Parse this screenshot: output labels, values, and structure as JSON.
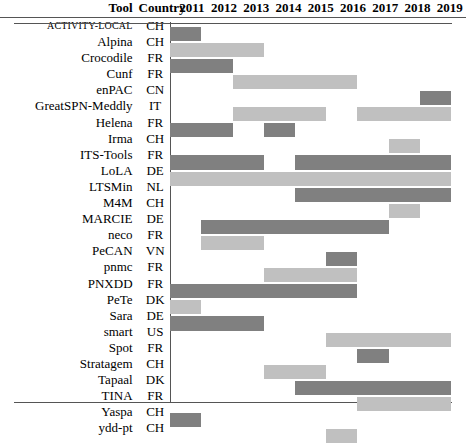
{
  "header": {
    "tool_label": "Tool",
    "country_label": "Country"
  },
  "colors": {
    "dark": "#808080",
    "light": "#c0c0c0",
    "rule": "#555555",
    "background": "#ffffff"
  },
  "chart_data": {
    "type": "heatmap",
    "title": "",
    "xlabel": "",
    "ylabel": "",
    "categories": [
      "2011",
      "2012",
      "2013",
      "2014",
      "2015",
      "2016",
      "2017",
      "2018",
      "2019"
    ],
    "legend": [
      {
        "name": "participated (dark)",
        "color": "#808080"
      },
      {
        "name": "participated (light)",
        "color": "#c0c0c0"
      }
    ],
    "rows": [
      {
        "tool": "ACTIVITY-LOCAL",
        "country": "CH",
        "smallcaps": true,
        "segments": [
          {
            "start": 0,
            "end": 0,
            "shade": "dark"
          }
        ],
        "years": [
          "2011"
        ]
      },
      {
        "tool": "Alpina",
        "country": "CH",
        "segments": [
          {
            "start": 0,
            "end": 2,
            "shade": "light"
          }
        ],
        "years": [
          "2011",
          "2012",
          "2013"
        ]
      },
      {
        "tool": "Crocodile",
        "country": "FR",
        "segments": [
          {
            "start": 0,
            "end": 1,
            "shade": "dark"
          }
        ],
        "years": [
          "2011",
          "2012"
        ]
      },
      {
        "tool": "Cunf",
        "country": "FR",
        "segments": [
          {
            "start": 2,
            "end": 5,
            "shade": "light"
          }
        ],
        "years": [
          "2013",
          "2014",
          "2015",
          "2016"
        ]
      },
      {
        "tool": "enPAC",
        "country": "CN",
        "segments": [
          {
            "start": 8,
            "end": 8,
            "shade": "dark"
          }
        ],
        "years": [
          "2019"
        ]
      },
      {
        "tool": "GreatSPN-Meddly",
        "country": "IT",
        "segments": [
          {
            "start": 2,
            "end": 4,
            "shade": "light"
          },
          {
            "start": 6,
            "end": 8,
            "shade": "light"
          }
        ],
        "years": [
          "2013",
          "2014",
          "2015",
          "2017",
          "2018",
          "2019"
        ]
      },
      {
        "tool": "Helena",
        "country": "FR",
        "segments": [
          {
            "start": 0,
            "end": 1,
            "shade": "dark"
          },
          {
            "start": 3,
            "end": 3,
            "shade": "dark"
          }
        ],
        "years": [
          "2011",
          "2012",
          "2014"
        ]
      },
      {
        "tool": "Irma",
        "country": "CH",
        "segments": [
          {
            "start": 7,
            "end": 7,
            "shade": "light"
          }
        ],
        "years": [
          "2018"
        ]
      },
      {
        "tool": "ITS-Tools",
        "country": "FR",
        "segments": [
          {
            "start": 0,
            "end": 2,
            "shade": "dark"
          },
          {
            "start": 4,
            "end": 8,
            "shade": "dark"
          }
        ],
        "years": [
          "2011",
          "2012",
          "2013",
          "2015",
          "2016",
          "2017",
          "2018",
          "2019"
        ]
      },
      {
        "tool": "LoLA",
        "country": "DE",
        "segments": [
          {
            "start": 0,
            "end": 8,
            "shade": "light"
          }
        ],
        "years": [
          "2011",
          "2012",
          "2013",
          "2014",
          "2015",
          "2016",
          "2017",
          "2018",
          "2019"
        ]
      },
      {
        "tool": "LTSMin",
        "country": "NL",
        "segments": [
          {
            "start": 4,
            "end": 8,
            "shade": "dark"
          }
        ],
        "years": [
          "2015",
          "2016",
          "2017",
          "2018",
          "2019"
        ]
      },
      {
        "tool": "M4M",
        "country": "CH",
        "segments": [
          {
            "start": 7,
            "end": 7,
            "shade": "light"
          }
        ],
        "years": [
          "2018"
        ]
      },
      {
        "tool": "MARCIE",
        "country": "DE",
        "segments": [
          {
            "start": 1,
            "end": 6,
            "shade": "dark"
          }
        ],
        "years": [
          "2012",
          "2013",
          "2014",
          "2015",
          "2016",
          "2017"
        ]
      },
      {
        "tool": "neco",
        "country": "FR",
        "segments": [
          {
            "start": 1,
            "end": 2,
            "shade": "light"
          }
        ],
        "years": [
          "2012",
          "2013"
        ]
      },
      {
        "tool": "PeCAN",
        "country": "VN",
        "segments": [
          {
            "start": 5,
            "end": 5,
            "shade": "dark"
          }
        ],
        "years": [
          "2016"
        ]
      },
      {
        "tool": "pnmc",
        "country": "FR",
        "segments": [
          {
            "start": 3,
            "end": 5,
            "shade": "light"
          }
        ],
        "years": [
          "2014",
          "2015",
          "2016"
        ]
      },
      {
        "tool": "PNXDD",
        "country": "FR",
        "segments": [
          {
            "start": 0,
            "end": 5,
            "shade": "dark"
          }
        ],
        "years": [
          "2011",
          "2012",
          "2013",
          "2014",
          "2015",
          "2016"
        ]
      },
      {
        "tool": "PeTe",
        "country": "DK",
        "segments": [
          {
            "start": 0,
            "end": 0,
            "shade": "light"
          }
        ],
        "years": [
          "2011"
        ]
      },
      {
        "tool": "Sara",
        "country": "DE",
        "segments": [
          {
            "start": 0,
            "end": 2,
            "shade": "dark"
          }
        ],
        "years": [
          "2011",
          "2012",
          "2013"
        ]
      },
      {
        "tool": "smart",
        "country": "US",
        "segments": [
          {
            "start": 5,
            "end": 8,
            "shade": "light"
          }
        ],
        "years": [
          "2016",
          "2017",
          "2018",
          "2019"
        ]
      },
      {
        "tool": "Spot",
        "country": "FR",
        "segments": [
          {
            "start": 6,
            "end": 6,
            "shade": "dark"
          }
        ],
        "years": [
          "2017"
        ]
      },
      {
        "tool": "Stratagem",
        "country": "CH",
        "segments": [
          {
            "start": 3,
            "end": 4,
            "shade": "light"
          }
        ],
        "years": [
          "2014",
          "2015"
        ]
      },
      {
        "tool": "Tapaal",
        "country": "DK",
        "segments": [
          {
            "start": 4,
            "end": 8,
            "shade": "dark"
          }
        ],
        "years": [
          "2015",
          "2016",
          "2017",
          "2018",
          "2019"
        ]
      },
      {
        "tool": "TINA",
        "country": "FR",
        "segments": [
          {
            "start": 6,
            "end": 8,
            "shade": "light"
          }
        ],
        "years": [
          "2017",
          "2018",
          "2019"
        ]
      },
      {
        "tool": "Yaspa",
        "country": "CH",
        "segments": [
          {
            "start": 0,
            "end": 0,
            "shade": "dark"
          }
        ],
        "years": [
          "2011"
        ]
      },
      {
        "tool": "ydd-pt",
        "country": "CH",
        "segments": [
          {
            "start": 5,
            "end": 5,
            "shade": "light"
          }
        ],
        "years": [
          "2016"
        ]
      }
    ]
  }
}
